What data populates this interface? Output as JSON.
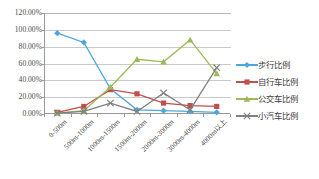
{
  "chart_data": {
    "type": "line",
    "title": "",
    "xlabel": "",
    "ylabel": "",
    "ylim": [
      0,
      1.2
    ],
    "ytick_labels": [
      "120.00%",
      "100.00%",
      "80.00%",
      "60.00%",
      "40.00%",
      "20.00%",
      "0.00%"
    ],
    "ytick_values": [
      1.2,
      1.0,
      0.8,
      0.6,
      0.4,
      0.2,
      0.0
    ],
    "grid": true,
    "legend_position": "right",
    "categories": [
      "0-500m",
      "500m-1000m",
      "1000m-1500m",
      "1500m-2000m",
      "2000m-3000m",
      "3000m-4000m",
      "4000m以上"
    ],
    "series": [
      {
        "name": "步行比例",
        "color": "#4da6dd",
        "marker": "diamond",
        "values": [
          0.96,
          0.85,
          0.3,
          0.05,
          0.04,
          0.03,
          0.02
        ]
      },
      {
        "name": "自行车比例",
        "color": "#c0504d",
        "marker": "square",
        "values": [
          0.02,
          0.09,
          0.29,
          0.24,
          0.13,
          0.1,
          0.09
        ]
      },
      {
        "name": "公交车比例",
        "color": "#9bbb59",
        "marker": "triangle",
        "values": [
          0.01,
          0.04,
          0.32,
          0.65,
          0.62,
          0.88,
          0.48
        ]
      },
      {
        "name": "小汽车比例",
        "color": "#7f7f7f",
        "marker": "cross",
        "values": [
          0.01,
          0.03,
          0.13,
          0.03,
          0.25,
          0.05,
          0.55
        ]
      }
    ]
  },
  "legend": {
    "items": [
      {
        "label": "步行比例"
      },
      {
        "label": "自行车比例"
      },
      {
        "label": "公交车比例"
      },
      {
        "label": "小汽车比例"
      }
    ]
  }
}
